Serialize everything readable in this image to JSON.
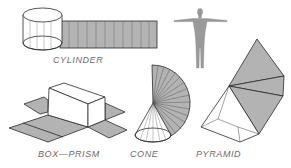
{
  "figure": {
    "labels": {
      "cylinder": "CYLINDER",
      "box_prism": "BOX—PRISM",
      "cone": "CONE",
      "pyramid": "PYRAMID"
    },
    "colors": {
      "net_fill": "#b3b3b3",
      "stroke": "#2a2a2a",
      "solid_fill": "#ffffff",
      "label": "#6a6a6a",
      "figure_body": "#9a9a9a"
    }
  }
}
